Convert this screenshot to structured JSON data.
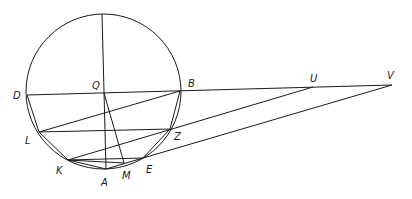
{
  "diagram": {
    "type": "geometric-construction",
    "circle": {
      "cx": 103.5,
      "cy": 91.5,
      "r": 77.5
    },
    "points": {
      "Top": [
        102,
        14
      ],
      "Q": [
        104,
        93
      ],
      "D": [
        27,
        95
      ],
      "B": [
        180,
        91
      ],
      "U": [
        313,
        87
      ],
      "V": [
        392,
        85
      ],
      "L": [
        39,
        132
      ],
      "Z": [
        170,
        129
      ],
      "K": [
        68,
        160
      ],
      "A": [
        106,
        169
      ],
      "M": [
        124,
        163
      ],
      "E": [
        143,
        158
      ]
    },
    "labels": [
      {
        "text": "D",
        "x": 13,
        "y": 99
      },
      {
        "text": "Q",
        "x": 92,
        "y": 89
      },
      {
        "text": "B",
        "x": 188,
        "y": 87
      },
      {
        "text": "U",
        "x": 310,
        "y": 82
      },
      {
        "text": "V",
        "x": 387,
        "y": 79
      },
      {
        "text": "L",
        "x": 25,
        "y": 144
      },
      {
        "text": "Z",
        "x": 174,
        "y": 140
      },
      {
        "text": "K",
        "x": 56,
        "y": 174
      },
      {
        "text": "A",
        "x": 101,
        "y": 186
      },
      {
        "text": "M",
        "x": 122,
        "y": 179
      },
      {
        "text": "E",
        "x": 146,
        "y": 173
      }
    ]
  }
}
